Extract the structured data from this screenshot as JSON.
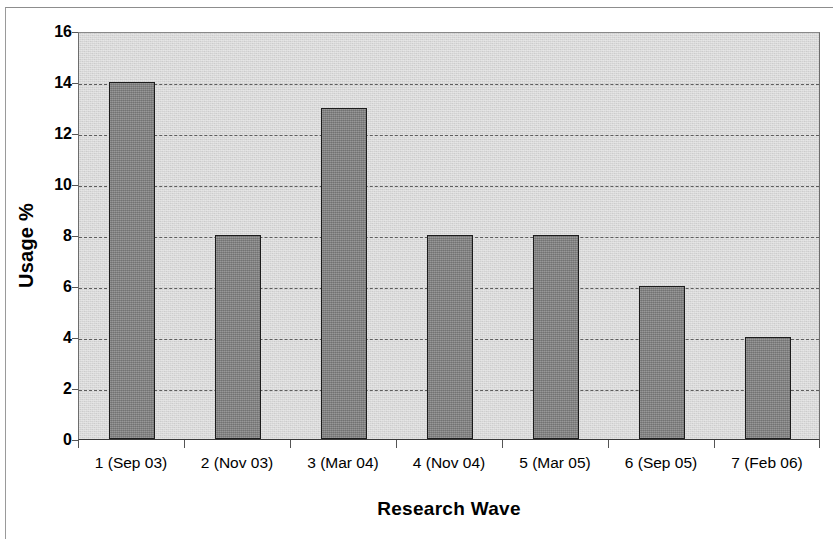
{
  "chart_data": {
    "type": "bar",
    "title": "",
    "subtitle": "",
    "xlabel": "Research Wave",
    "ylabel": "Usage %",
    "categories": [
      "1 (Sep 03)",
      "2 (Nov 03)",
      "3 (Mar 04)",
      "4 (Nov 04)",
      "5 (Mar 05)",
      "6 (Sep 05)",
      "7 (Feb 06)"
    ],
    "values": [
      14,
      8,
      13,
      8,
      8,
      6,
      4
    ],
    "ylim": [
      0,
      16
    ],
    "ytick_labels": [
      "16",
      "14",
      "12",
      "10",
      "8",
      "6",
      "4",
      "2",
      "0"
    ],
    "ytick_values": [
      16,
      14,
      12,
      10,
      8,
      6,
      4,
      2,
      0
    ],
    "ystep": 2,
    "grid": true,
    "grid_axis": "y",
    "grid_style": "dashed",
    "legend": "none",
    "bar_fill_color": "#838383",
    "bar_border_color": "#1c1c1c",
    "plot_background_color": "#d9d9d9",
    "gridline_color": "#5d5d5d",
    "axis_color": "#3a3a3a",
    "page_background_color": "#ffffff"
  }
}
